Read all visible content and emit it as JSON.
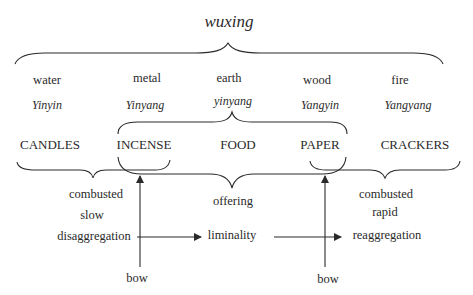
{
  "title": "wuxing",
  "elements": [
    "water",
    "metal",
    "earth",
    "wood",
    "fire"
  ],
  "yinyang_labels": [
    "Yinyin",
    "Yinyang",
    "yinyang",
    "Yangyin",
    "Yangyang"
  ],
  "items": [
    "CANDLES",
    "INCENSE",
    "FOOD",
    "PAPER",
    "CRACKERS"
  ],
  "left_group": {
    "line1": "combusted",
    "line2": "slow",
    "line3": "disaggregation"
  },
  "middle_group": {
    "line1": "offering",
    "line2": "liminality"
  },
  "right_group": {
    "line1": "combusted",
    "line2": "rapid",
    "line3": "reaggregation"
  },
  "bow_left": "bow",
  "bow_right": "bow",
  "colors": {
    "stroke": "#2a2a2a",
    "text": "#2a2a2a",
    "background": "#ffffff"
  }
}
